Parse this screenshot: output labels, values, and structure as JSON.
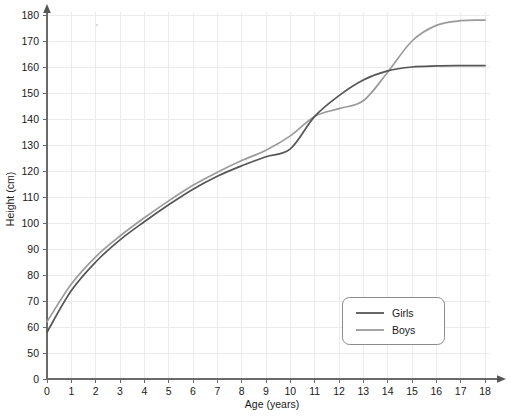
{
  "chart_data": {
    "type": "line",
    "title": "",
    "xlabel": "Age (years)",
    "ylabel": "Height (cm)",
    "xlim": [
      0,
      18
    ],
    "ylim": [
      50,
      180
    ],
    "y_axis_break_below": 50,
    "grid": true,
    "legend_position": "bottom-right",
    "x_ticks": [
      0,
      1,
      2,
      3,
      4,
      5,
      6,
      7,
      8,
      9,
      10,
      11,
      12,
      13,
      14,
      15,
      16,
      17,
      18
    ],
    "x_tick_labels": [
      "0",
      "1",
      "2",
      "3",
      "4",
      "5",
      "6",
      "7",
      "8",
      "9",
      "10",
      "11",
      "12",
      "13",
      "14",
      "15",
      "16",
      "17",
      "18"
    ],
    "y_ticks": [
      0,
      50,
      60,
      70,
      80,
      90,
      100,
      110,
      120,
      130,
      140,
      150,
      160,
      170,
      180
    ],
    "y_tick_labels": [
      "0",
      "50",
      "60",
      "70",
      "80",
      "90",
      "100",
      "110",
      "120",
      "130",
      "140",
      "150",
      "160",
      "170",
      "180"
    ],
    "x": [
      0,
      1,
      2,
      3,
      4,
      5,
      6,
      7,
      8,
      9,
      10,
      11,
      12,
      13,
      14,
      15,
      16,
      17,
      18
    ],
    "series": [
      {
        "name": "Girls",
        "color": "#555555",
        "values": [
          58,
          74,
          85,
          93.5,
          100.5,
          107,
          113,
          118,
          122,
          125.5,
          128.5,
          141,
          149,
          155,
          158.5,
          160,
          160.4,
          160.5,
          160.5
        ]
      },
      {
        "name": "Boys",
        "color": "#9b9b9b",
        "values": [
          62,
          76.5,
          87,
          95,
          102,
          108.5,
          114.5,
          119.5,
          124,
          128,
          133.5,
          141,
          144,
          147,
          158,
          170,
          176,
          177.8,
          178
        ]
      }
    ],
    "annotations": {
      "crossovers": [
        {
          "age": 11,
          "height": 141
        },
        {
          "age": 13.8,
          "height": 158
        }
      ]
    }
  },
  "legend": {
    "entries": [
      {
        "label": "Girls",
        "color": "#555555"
      },
      {
        "label": "Boys",
        "color": "#9b9b9b"
      }
    ]
  },
  "axes": {
    "x_title": "Age (years)",
    "y_title": "Height (cm)"
  }
}
